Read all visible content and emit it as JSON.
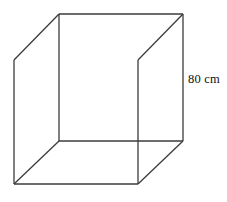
{
  "figure": {
    "kind": "geometry-diagram",
    "shape_name": "cube",
    "background_color": "#ffffff",
    "line_color": "#3b3b3b",
    "hidden_line_color": "#c8c8c8",
    "label_color": "#111111",
    "labels": {
      "edge_length": "80 cm"
    },
    "geometry": {
      "front_face": [
        [
          14,
          60
        ],
        [
          138,
          60
        ],
        [
          138,
          184
        ],
        [
          14,
          184
        ]
      ],
      "back_face": [
        [
          59,
          14
        ],
        [
          183,
          14
        ],
        [
          183,
          141
        ],
        [
          59,
          141
        ]
      ],
      "connectors": [
        [
          [
            14,
            60
          ],
          [
            59,
            14
          ]
        ],
        [
          [
            138,
            60
          ],
          [
            183,
            14
          ]
        ],
        [
          [
            138,
            184
          ],
          [
            183,
            141
          ]
        ],
        [
          [
            14,
            184
          ],
          [
            59,
            141
          ]
        ]
      ],
      "hidden_edges": [
        [
          [
            14,
            60
          ],
          [
            138,
            60
          ]
        ]
      ]
    }
  }
}
